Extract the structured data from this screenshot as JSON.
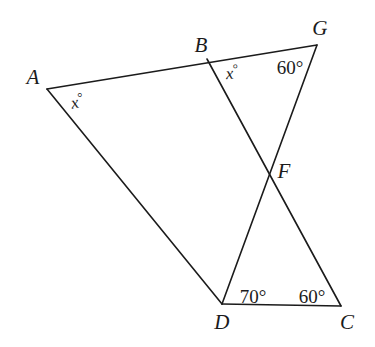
{
  "figure": {
    "width": 375,
    "height": 347,
    "background_color": "#ffffff",
    "stroke_color": "#1b1b1b",
    "stroke_width": 1.6,
    "points": {
      "A": {
        "x": 47,
        "y": 89
      },
      "B": {
        "x": 207,
        "y": 59
      },
      "G": {
        "x": 317,
        "y": 45
      },
      "F": {
        "x": 268,
        "y": 175
      },
      "D": {
        "x": 222,
        "y": 304
      },
      "C": {
        "x": 341,
        "y": 306
      }
    },
    "segments": [
      {
        "name": "segment-A-G",
        "from": "A",
        "to": "G",
        "note": "straight line through B"
      },
      {
        "name": "segment-B-C",
        "from": "B",
        "to": "C",
        "note": "passes through F"
      },
      {
        "name": "segment-G-D",
        "from": "G",
        "to": "D",
        "note": "passes through F"
      },
      {
        "name": "segment-A-D",
        "from": "A",
        "to": "D"
      },
      {
        "name": "segment-D-C",
        "from": "D",
        "to": "C"
      }
    ],
    "vertex_labels": [
      {
        "name": "vertex-label-A",
        "text": "A",
        "x": 33,
        "y": 77
      },
      {
        "name": "vertex-label-B",
        "text": "B",
        "x": 201,
        "y": 45
      },
      {
        "name": "vertex-label-G",
        "text": "G",
        "x": 320,
        "y": 28
      },
      {
        "name": "vertex-label-F",
        "text": "F",
        "x": 284,
        "y": 171
      },
      {
        "name": "vertex-label-D",
        "text": "D",
        "x": 222,
        "y": 322
      },
      {
        "name": "vertex-label-C",
        "text": "C",
        "x": 347,
        "y": 322
      }
    ],
    "angle_labels": [
      {
        "name": "angle-label-A",
        "value": "x",
        "unit": "°",
        "text": "x°",
        "x": 77,
        "y": 101,
        "at_vertex": "A",
        "style": "var",
        "rotation": "rot-a"
      },
      {
        "name": "angle-label-B",
        "value": "x",
        "unit": "°",
        "text": "x°",
        "x": 232,
        "y": 72,
        "at_vertex": "B",
        "style": "var",
        "rotation": "rot-b"
      },
      {
        "name": "angle-label-G",
        "value": "60",
        "unit": "°",
        "text": "60°",
        "x": 290,
        "y": 67,
        "at_vertex": "G",
        "style": "plain",
        "rotation": ""
      },
      {
        "name": "angle-label-D-interior",
        "value": "70",
        "unit": "°",
        "text": "70°",
        "x": 253,
        "y": 296,
        "at_vertex": "D",
        "style": "plain",
        "rotation": ""
      },
      {
        "name": "angle-label-C",
        "value": "60",
        "unit": "°",
        "text": "60°",
        "x": 312,
        "y": 296,
        "at_vertex": "C",
        "style": "plain",
        "rotation": ""
      }
    ]
  }
}
